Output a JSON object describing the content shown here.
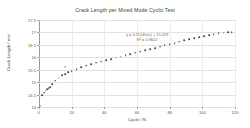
{
  "chart_data": {
    "type": "scatter",
    "title": "Crack Length per Mixed Mode Cyclic Test",
    "xlabel": "Cycle / N",
    "ylabel": "Crack Length / mm",
    "xlim": [
      0,
      120
    ],
    "ylim": [
      14,
      17.5
    ],
    "xticks": [
      0,
      20,
      40,
      60,
      80,
      100,
      120
    ],
    "xtick_labels": [
      "0",
      "20",
      "40",
      "60",
      "80",
      "100",
      "120"
    ],
    "yticks": [
      14,
      14.5,
      15,
      15.5,
      16,
      16.5,
      17,
      17.5
    ],
    "ytick_labels": [
      "14",
      "14.5",
      "15",
      "15.5",
      "16",
      "16.5",
      "17",
      "17.5"
    ],
    "grid": true,
    "legend": "none",
    "marker_color": "#4a4a4a",
    "annotations": [
      "y = 0.2514ln(x) + 15.029",
      "R² = 0.9602"
    ],
    "x": [
      1,
      2,
      3,
      4,
      5,
      6,
      7,
      8,
      10,
      12,
      14,
      16,
      18,
      20,
      23,
      26,
      29,
      32,
      35,
      38,
      41,
      44,
      47,
      50,
      53,
      56,
      59,
      62,
      65,
      68,
      71,
      74,
      77,
      80,
      83,
      86,
      89,
      92,
      95,
      98,
      101,
      104,
      107,
      110,
      113,
      116,
      118
    ],
    "y": [
      14.05,
      14.48,
      14.58,
      14.66,
      14.72,
      14.76,
      14.8,
      14.93,
      15.06,
      15.18,
      15.27,
      15.33,
      15.39,
      15.45,
      15.53,
      15.6,
      15.66,
      15.72,
      15.78,
      15.83,
      15.88,
      15.93,
      15.98,
      16.03,
      16.08,
      16.13,
      16.18,
      16.23,
      16.28,
      16.33,
      16.38,
      16.43,
      16.48,
      16.53,
      16.58,
      16.63,
      16.68,
      16.73,
      16.78,
      16.82,
      16.86,
      16.9,
      16.93,
      16.96,
      16.99,
      17.01,
      17.02
    ],
    "stray_points": [
      {
        "x": 16,
        "y": 15.62
      }
    ]
  }
}
